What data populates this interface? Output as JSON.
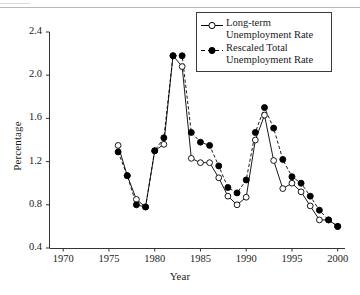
{
  "figure": {
    "ylabel": "Percentage",
    "xlabel": "Year"
  },
  "legend": {
    "entries": [
      {
        "label": "Long-term\nUnemployment Rate",
        "marker": "open-circle",
        "line": "solid",
        "color": "#000000"
      },
      {
        "label": "Rescaled Total\nUnemployment Rate",
        "marker": "filled-circle",
        "line": "dashed",
        "color": "#000000"
      }
    ]
  },
  "axes": {
    "y_ticks": [
      "0.4",
      "0.8",
      "1.2",
      "1.6",
      "2.0",
      "2.4"
    ],
    "x_ticks": [
      "1970",
      "1975",
      "1980",
      "1985",
      "1990",
      "1995",
      "2000"
    ]
  },
  "chart_data": {
    "type": "line",
    "title": "",
    "xlabel": "Year",
    "ylabel": "Percentage",
    "xlim": [
      1968.5,
      2000.8
    ],
    "ylim": [
      0.4,
      2.4
    ],
    "xticks": [
      1970,
      1975,
      1980,
      1985,
      1990,
      1995,
      2000
    ],
    "yticks": [
      0.4,
      0.8,
      1.2,
      1.6,
      2.0,
      2.4
    ],
    "grid": false,
    "legend_position": "top-right",
    "x": [
      1976,
      1977,
      1978,
      1979,
      1980,
      1981,
      1982,
      1983,
      1984,
      1985,
      1986,
      1987,
      1988,
      1989,
      1990,
      1991,
      1992,
      1993,
      1994,
      1995,
      1996,
      1997,
      1998,
      1999,
      2000
    ],
    "series": [
      {
        "name": "Long-term Unemployment Rate",
        "marker": "open-circle",
        "line": "solid",
        "values": [
          1.35,
          1.07,
          0.85,
          0.78,
          1.3,
          1.36,
          2.18,
          2.08,
          1.23,
          1.19,
          1.19,
          1.05,
          0.88,
          0.8,
          0.87,
          1.4,
          1.63,
          1.21,
          0.95,
          1.0,
          0.92,
          0.79,
          0.66,
          0.66,
          0.6
        ]
      },
      {
        "name": "Rescaled Total Unemployment Rate",
        "marker": "filled-circle",
        "line": "dashed",
        "values": [
          1.29,
          1.07,
          0.8,
          0.78,
          1.3,
          1.42,
          2.18,
          2.18,
          1.47,
          1.38,
          1.35,
          1.16,
          0.96,
          0.91,
          1.03,
          1.47,
          1.7,
          1.51,
          1.22,
          1.06,
          1.0,
          0.88,
          0.75,
          0.66,
          0.6
        ]
      }
    ]
  }
}
